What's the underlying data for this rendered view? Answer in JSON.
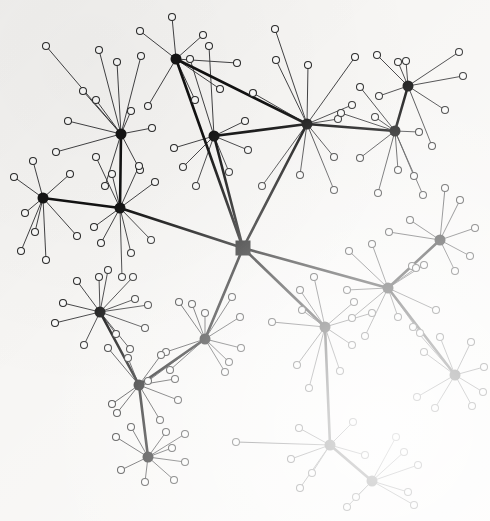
{
  "figure": {
    "kind": "node-link-graph",
    "width": 490,
    "height": 521,
    "background_color": "#f7f6f4",
    "node_color": "#141414",
    "leaf_fill_color": "#fbfbfa",
    "leaf_stroke_color": "#2b2b2b",
    "edge_color": "#38383a",
    "backbone_edge_color": "#121212"
  },
  "chart_data": {
    "type": "scatter",
    "xlabel": "",
    "ylabel": "",
    "xlim": [
      0,
      490
    ],
    "ylim": [
      0,
      521
    ],
    "grid": false,
    "legend": "none",
    "root_node": "H0",
    "hub_count": 19,
    "leaf_count": 155,
    "backbone_edge_count": 20,
    "nodes": [
      {
        "id": "H0",
        "x": 243,
        "y": 248,
        "type": "root",
        "shape": "square",
        "size": 15
      },
      {
        "id": "H1",
        "x": 176,
        "y": 59,
        "type": "hub",
        "shape": "circle",
        "size": 11
      },
      {
        "id": "H2",
        "x": 121,
        "y": 134,
        "type": "hub",
        "shape": "circle",
        "size": 11
      },
      {
        "id": "H3",
        "x": 214,
        "y": 136,
        "type": "hub",
        "shape": "circle",
        "size": 11
      },
      {
        "id": "H4",
        "x": 307,
        "y": 124,
        "type": "hub",
        "shape": "circle",
        "size": 11
      },
      {
        "id": "H5",
        "x": 408,
        "y": 86,
        "type": "hub",
        "shape": "circle",
        "size": 11
      },
      {
        "id": "H6",
        "x": 395,
        "y": 131,
        "type": "hub",
        "shape": "circle",
        "size": 11
      },
      {
        "id": "H7",
        "x": 43,
        "y": 198,
        "type": "hub",
        "shape": "circle",
        "size": 11
      },
      {
        "id": "H8",
        "x": 120,
        "y": 208,
        "type": "hub",
        "shape": "circle",
        "size": 11
      },
      {
        "id": "H9",
        "x": 440,
        "y": 240,
        "type": "hub",
        "shape": "circle",
        "size": 11
      },
      {
        "id": "H10",
        "x": 388,
        "y": 288,
        "type": "hub",
        "shape": "circle",
        "size": 11
      },
      {
        "id": "H11",
        "x": 100,
        "y": 312,
        "type": "hub",
        "shape": "circle",
        "size": 11
      },
      {
        "id": "H12",
        "x": 205,
        "y": 339,
        "type": "hub",
        "shape": "circle",
        "size": 11
      },
      {
        "id": "H13",
        "x": 325,
        "y": 327,
        "type": "hub",
        "shape": "circle",
        "size": 11
      },
      {
        "id": "H14",
        "x": 139,
        "y": 385,
        "type": "hub",
        "shape": "circle",
        "size": 11
      },
      {
        "id": "H15",
        "x": 455,
        "y": 375,
        "type": "hub",
        "shape": "circle",
        "size": 11
      },
      {
        "id": "H16",
        "x": 148,
        "y": 457,
        "type": "hub",
        "shape": "circle",
        "size": 11
      },
      {
        "id": "H17",
        "x": 330,
        "y": 445,
        "type": "hub",
        "shape": "circle",
        "size": 11
      },
      {
        "id": "H18",
        "x": 372,
        "y": 481,
        "type": "hub",
        "shape": "circle",
        "size": 11
      }
    ],
    "backbone_edges": [
      [
        "H0",
        "H1"
      ],
      [
        "H0",
        "H3"
      ],
      [
        "H0",
        "H4"
      ],
      [
        "H0",
        "H8"
      ],
      [
        "H0",
        "H10"
      ],
      [
        "H0",
        "H12"
      ],
      [
        "H0",
        "H13"
      ],
      [
        "H1",
        "H4"
      ],
      [
        "H2",
        "H8"
      ],
      [
        "H7",
        "H8"
      ],
      [
        "H5",
        "H6"
      ],
      [
        "H6",
        "H4"
      ],
      [
        "H9",
        "H10"
      ],
      [
        "H10",
        "H15"
      ],
      [
        "H11",
        "H14"
      ],
      [
        "H12",
        "H14"
      ],
      [
        "H14",
        "H16"
      ],
      [
        "H13",
        "H17"
      ],
      [
        "H17",
        "H18"
      ],
      [
        "H4",
        "H3"
      ]
    ],
    "leaf_edges": [
      {
        "hub": "H1",
        "leaves": [
          [
            140,
            31
          ],
          [
            172,
            17
          ],
          [
            203,
            35
          ],
          [
            237,
            63
          ],
          [
            220,
            89
          ],
          [
            195,
            100
          ],
          [
            148,
            106
          ]
        ]
      },
      {
        "hub": "H2",
        "leaves": [
          [
            46,
            46
          ],
          [
            99,
            50
          ],
          [
            117,
            62
          ],
          [
            141,
            56
          ],
          [
            83,
            91
          ],
          [
            96,
            100
          ],
          [
            152,
            128
          ],
          [
            105,
            186
          ],
          [
            140,
            170
          ],
          [
            68,
            121
          ],
          [
            56,
            152
          ],
          [
            131,
            111
          ]
        ]
      },
      {
        "hub": "H3",
        "leaves": [
          [
            209,
            46
          ],
          [
            190,
            59
          ],
          [
            174,
            148
          ],
          [
            245,
            121
          ],
          [
            248,
            150
          ],
          [
            183,
            167
          ],
          [
            229,
            172
          ],
          [
            196,
            186
          ]
        ]
      },
      {
        "hub": "H4",
        "leaves": [
          [
            275,
            29
          ],
          [
            276,
            60
          ],
          [
            308,
            65
          ],
          [
            253,
            93
          ],
          [
            355,
            57
          ],
          [
            352,
            105
          ],
          [
            338,
            119
          ],
          [
            334,
            157
          ],
          [
            300,
            175
          ],
          [
            262,
            186
          ],
          [
            334,
            190
          ]
        ]
      },
      {
        "hub": "H5",
        "leaves": [
          [
            377,
            55
          ],
          [
            398,
            62
          ],
          [
            406,
            61
          ],
          [
            459,
            52
          ],
          [
            463,
            76
          ],
          [
            445,
            110
          ],
          [
            432,
            146
          ],
          [
            379,
            96
          ]
        ]
      },
      {
        "hub": "H6",
        "leaves": [
          [
            360,
            87
          ],
          [
            341,
            113
          ],
          [
            375,
            117
          ],
          [
            419,
            132
          ],
          [
            360,
            158
          ],
          [
            398,
            170
          ],
          [
            414,
            176
          ],
          [
            423,
            195
          ],
          [
            378,
            193
          ]
        ]
      },
      {
        "hub": "H7",
        "leaves": [
          [
            14,
            177
          ],
          [
            33,
            161
          ],
          [
            25,
            213
          ],
          [
            35,
            232
          ],
          [
            70,
            174
          ],
          [
            77,
            236
          ],
          [
            46,
            260
          ],
          [
            21,
            251
          ]
        ]
      },
      {
        "hub": "H8",
        "leaves": [
          [
            96,
            157
          ],
          [
            112,
            174
          ],
          [
            139,
            166
          ],
          [
            155,
            182
          ],
          [
            94,
            227
          ],
          [
            101,
            243
          ],
          [
            131,
            253
          ],
          [
            151,
            240
          ],
          [
            122,
            277
          ]
        ]
      },
      {
        "hub": "H9",
        "leaves": [
          [
            389,
            232
          ],
          [
            410,
            220
          ],
          [
            412,
            266
          ],
          [
            445,
            188
          ],
          [
            460,
            200
          ],
          [
            475,
            228
          ],
          [
            455,
            271
          ],
          [
            470,
            256
          ]
        ]
      },
      {
        "hub": "H10",
        "leaves": [
          [
            349,
            251
          ],
          [
            372,
            244
          ],
          [
            416,
            268
          ],
          [
            424,
            265
          ],
          [
            347,
            290
          ],
          [
            352,
            318
          ],
          [
            398,
            317
          ],
          [
            436,
            310
          ],
          [
            420,
            333
          ],
          [
            365,
            336
          ]
        ]
      },
      {
        "hub": "H11",
        "leaves": [
          [
            77,
            281
          ],
          [
            99,
            277
          ],
          [
            108,
            270
          ],
          [
            133,
            277
          ],
          [
            135,
            299
          ],
          [
            148,
            305
          ],
          [
            145,
            328
          ],
          [
            130,
            349
          ],
          [
            63,
            303
          ],
          [
            55,
            323
          ],
          [
            84,
            345
          ],
          [
            116,
            334
          ]
        ]
      },
      {
        "hub": "H12",
        "leaves": [
          [
            179,
            302
          ],
          [
            192,
            304
          ],
          [
            205,
            313
          ],
          [
            232,
            297
          ],
          [
            240,
            317
          ],
          [
            241,
            348
          ],
          [
            166,
            352
          ],
          [
            170,
            370
          ],
          [
            148,
            381
          ],
          [
            229,
            362
          ],
          [
            225,
            372
          ]
        ]
      },
      {
        "hub": "H13",
        "leaves": [
          [
            272,
            322
          ],
          [
            302,
            310
          ],
          [
            300,
            290
          ],
          [
            314,
            277
          ],
          [
            354,
            302
          ],
          [
            352,
            345
          ],
          [
            372,
            313
          ],
          [
            297,
            365
          ],
          [
            309,
            388
          ],
          [
            340,
            371
          ]
        ]
      },
      {
        "hub": "H14",
        "leaves": [
          [
            108,
            348
          ],
          [
            128,
            358
          ],
          [
            161,
            355
          ],
          [
            112,
            404
          ],
          [
            117,
            413
          ],
          [
            175,
            379
          ],
          [
            178,
            400
          ],
          [
            160,
            420
          ]
        ]
      },
      {
        "hub": "H15",
        "leaves": [
          [
            413,
            327
          ],
          [
            424,
            352
          ],
          [
            440,
            337
          ],
          [
            471,
            342
          ],
          [
            484,
            367
          ],
          [
            483,
            392
          ],
          [
            472,
            406
          ],
          [
            435,
            408
          ],
          [
            417,
            397
          ]
        ]
      },
      {
        "hub": "H16",
        "leaves": [
          [
            116,
            437
          ],
          [
            131,
            427
          ],
          [
            166,
            432
          ],
          [
            185,
            434
          ],
          [
            121,
            470
          ],
          [
            145,
            482
          ],
          [
            172,
            448
          ],
          [
            185,
            462
          ],
          [
            174,
            480
          ]
        ]
      },
      {
        "hub": "H17",
        "leaves": [
          [
            236,
            442
          ],
          [
            299,
            428
          ],
          [
            353,
            422
          ],
          [
            365,
            455
          ],
          [
            312,
            473
          ],
          [
            300,
            488
          ],
          [
            291,
            459
          ]
        ]
      },
      {
        "hub": "H18",
        "leaves": [
          [
            396,
            437
          ],
          [
            404,
            452
          ],
          [
            408,
            492
          ],
          [
            414,
            505
          ],
          [
            347,
            507
          ],
          [
            356,
            497
          ],
          [
            418,
            465
          ]
        ]
      }
    ]
  }
}
